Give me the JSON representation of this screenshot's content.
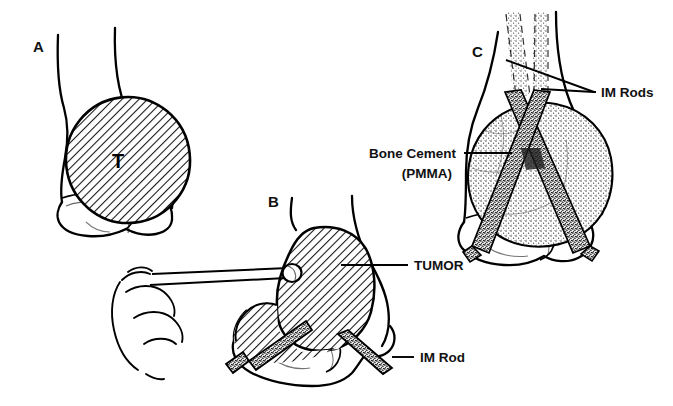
{
  "figure": {
    "background_color": "#ffffff",
    "ink_color": "#000000",
    "width": 673,
    "height": 406
  },
  "panels": [
    {
      "id": "A",
      "letter": "A",
      "name": "tumor-in-distal-femur",
      "caption_letter_position": {
        "x": 33,
        "y": 52
      },
      "tumor_label": "T",
      "fill_pattern": "diagonal-hatch"
    },
    {
      "id": "B",
      "letter": "B",
      "name": "curettage-and-rod-placement",
      "caption_letter_position": {
        "x": 268,
        "y": 207
      },
      "fill_pattern": "diagonal-hatch"
    },
    {
      "id": "C",
      "letter": "C",
      "name": "cementation-with-crossed-rods",
      "caption_letter_position": {
        "x": 472,
        "y": 57
      },
      "fill_pattern": "stipple"
    }
  ],
  "callouts": {
    "tumor": {
      "text": "TUMOR",
      "panel": "B",
      "anchor": {
        "x": 341,
        "y": 265
      },
      "label_position": {
        "x": 416,
        "y": 270
      }
    },
    "im_rod_single": {
      "text": "IM Rod",
      "panel": "B",
      "anchor": {
        "x": 392,
        "y": 357
      },
      "label_position": {
        "x": 421,
        "y": 362
      }
    },
    "im_rods_plural": {
      "text": "IM Rods",
      "panel": "C",
      "anchor_upper": {
        "x": 506,
        "y": 60
      },
      "anchor_lower": {
        "x": 541,
        "y": 89
      },
      "label_position": {
        "x": 602,
        "y": 96
      }
    },
    "bone_cement": {
      "line1": "Bone Cement",
      "line2": "(PMMA)",
      "panel": "C",
      "anchor": {
        "x": 512,
        "y": 153
      },
      "label_position": {
        "x": 425,
        "y": 153
      }
    }
  },
  "legend_terms": {
    "tumor": "TUMOR",
    "im_rod": "IM Rod",
    "im_rods": "IM Rods",
    "bone_cement": "Bone Cement",
    "pmma": "(PMMA)",
    "tumor_abbrev": "T"
  }
}
